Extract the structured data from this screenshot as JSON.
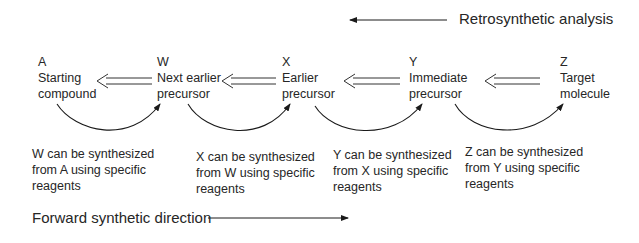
{
  "retro": {
    "label": "Retrosynthetic analysis",
    "direction": "left"
  },
  "forward": {
    "label": "Forward synthetic direction",
    "direction": "right"
  },
  "nodes": [
    {
      "letter": "A",
      "line1": "Starting",
      "line2": "compound"
    },
    {
      "letter": "W",
      "line1": "Next earlier",
      "line2": "precursor"
    },
    {
      "letter": "X",
      "line1": "Earlier",
      "line2": "precursor"
    },
    {
      "letter": "Y",
      "line1": "Immediate",
      "line2": "precursor"
    },
    {
      "letter": "Z",
      "line1": "Target",
      "line2": "molecule"
    }
  ],
  "captions": [
    {
      "line1": "W can be synthesized",
      "line2": "from A using specific",
      "line3": "reagents"
    },
    {
      "line1": "X can be synthesized",
      "line2": "from W using specific",
      "line3": "reagents"
    },
    {
      "line1": "Y can be synthesized",
      "line2": "from X using specific",
      "line3": "reagents"
    },
    {
      "line1": "Z can be synthesized",
      "line2": "from Y using specific",
      "line3": "reagents"
    }
  ],
  "colors": {
    "line": "#1a1a1a",
    "text": "#262626"
  }
}
